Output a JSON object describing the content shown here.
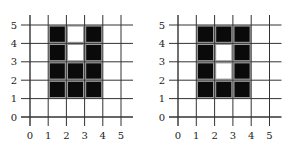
{
  "panels": [
    {
      "name": "left-grid",
      "origin_px": [
        30,
        117
      ],
      "step_px": [
        18.2,
        18.4
      ],
      "x_ticks": [
        "0",
        "1",
        "2",
        "3",
        "4",
        "5"
      ],
      "y_ticks": [
        "0",
        "1",
        "2",
        "3",
        "4",
        "5"
      ],
      "cells": [
        {
          "x": 1,
          "y": 1,
          "filled": true
        },
        {
          "x": 1,
          "y": 2,
          "filled": true
        },
        {
          "x": 1,
          "y": 3,
          "filled": true
        },
        {
          "x": 1,
          "y": 4,
          "filled": true
        },
        {
          "x": 2,
          "y": 1,
          "filled": true
        },
        {
          "x": 2,
          "y": 2,
          "filled": true
        },
        {
          "x": 2,
          "y": 3,
          "filled": false
        },
        {
          "x": 2,
          "y": 4,
          "filled": false
        },
        {
          "x": 3,
          "y": 1,
          "filled": true
        },
        {
          "x": 3,
          "y": 2,
          "filled": true
        },
        {
          "x": 3,
          "y": 3,
          "filled": true
        },
        {
          "x": 3,
          "y": 4,
          "filled": true
        }
      ]
    },
    {
      "name": "right-grid",
      "origin_px": [
        178,
        117
      ],
      "step_px": [
        18.3,
        18.4
      ],
      "x_ticks": [
        "0",
        "1",
        "2",
        "3",
        "4",
        "5"
      ],
      "y_ticks": [
        "0",
        "1",
        "2",
        "3",
        "4",
        "5"
      ],
      "cells": [
        {
          "x": 1,
          "y": 1,
          "filled": true
        },
        {
          "x": 1,
          "y": 2,
          "filled": true
        },
        {
          "x": 1,
          "y": 3,
          "filled": true
        },
        {
          "x": 1,
          "y": 4,
          "filled": true
        },
        {
          "x": 2,
          "y": 1,
          "filled": true
        },
        {
          "x": 2,
          "y": 2,
          "filled": false
        },
        {
          "x": 2,
          "y": 3,
          "filled": false
        },
        {
          "x": 2,
          "y": 4,
          "filled": true
        },
        {
          "x": 3,
          "y": 1,
          "filled": true
        },
        {
          "x": 3,
          "y": 2,
          "filled": true
        },
        {
          "x": 3,
          "y": 3,
          "filled": true
        },
        {
          "x": 3,
          "y": 4,
          "filled": true
        }
      ]
    }
  ],
  "colors": {
    "filled": "#0a0a0a",
    "empty": "#ffffff",
    "grid": "#333333",
    "cell_border": "#9a9a9a"
  }
}
